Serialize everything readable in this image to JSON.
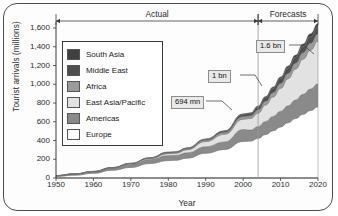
{
  "chart_data": {
    "type": "area",
    "title": "",
    "xlabel": "Year",
    "ylabel": "Tourist arrivals (millions)",
    "xlim": [
      1950,
      2020
    ],
    "ylim": [
      0,
      1600
    ],
    "ytick_labels": [
      "0",
      "200",
      "400",
      "600",
      "800",
      "1,000",
      "1,200",
      "1,400",
      "1,600"
    ],
    "ytick_values": [
      0,
      200,
      400,
      600,
      800,
      1000,
      1200,
      1400,
      1600
    ],
    "xtick_labels": [
      "1950",
      "1960",
      "1970",
      "1980",
      "1990",
      "2000",
      "2010",
      "2020"
    ],
    "xtick_values": [
      1950,
      1960,
      1970,
      1980,
      1990,
      2000,
      2010,
      2020
    ],
    "grid": false,
    "stacked": true,
    "legend_position": "upper-left inside",
    "x": [
      1950,
      1955,
      1960,
      1965,
      1970,
      1975,
      1980,
      1982,
      1985,
      1990,
      1995,
      2000,
      2002,
      2004,
      2006,
      2008,
      2010,
      2012,
      2014,
      2016,
      2018,
      2020
    ],
    "series": [
      {
        "name": "Europe",
        "color": "#ffffff",
        "values": [
          17,
          30,
          50,
          83,
          113,
          154,
          186,
          190,
          212,
          265,
          304,
          390,
          394,
          424,
          465,
          505,
          545,
          590,
          635,
          680,
          720,
          760
        ]
      },
      {
        "name": "Americas",
        "color": "#8a8a8a",
        "values": [
          8,
          12,
          17,
          23,
          33,
          43,
          53,
          52,
          57,
          69,
          81,
          128,
          117,
          126,
          139,
          152,
          166,
          181,
          197,
          213,
          229,
          245
        ]
      },
      {
        "name": "East Asia/Pacific",
        "color": "#e2e2e2",
        "values": [
          0.2,
          1,
          1.5,
          2.5,
          6,
          10,
          21,
          22,
          32,
          55,
          81,
          110,
          124,
          142,
          175,
          208,
          245,
          288,
          330,
          375,
          415,
          455
        ]
      },
      {
        "name": "Africa",
        "color": "#9b9b9b",
        "values": [
          0.5,
          1,
          1,
          1.5,
          2.5,
          5,
          7.5,
          8,
          10,
          15,
          20,
          27,
          29,
          33,
          39,
          45,
          51,
          57,
          63,
          68,
          73,
          77
        ]
      },
      {
        "name": "Middle East",
        "color": "#4f4f4f",
        "values": [
          0.2,
          0.4,
          0.6,
          1.5,
          2,
          3,
          7,
          7,
          8,
          10,
          14,
          24,
          26,
          36,
          42,
          48,
          54,
          58,
          62,
          66,
          70,
          74
        ]
      },
      {
        "name": "South Asia",
        "color": "#404040",
        "values": [
          0.2,
          0.3,
          0.5,
          0.8,
          1,
          2,
          2,
          2,
          2.5,
          3,
          4,
          6,
          6,
          8,
          10,
          13,
          16,
          20,
          24,
          28,
          33,
          37
        ]
      }
    ],
    "annotations": [
      {
        "label": "694 mn",
        "year": 2003,
        "value": 694
      },
      {
        "label": "1 bn",
        "year": 2010,
        "value": 1000
      },
      {
        "label": "1.6 bn",
        "year": 2020,
        "value": 1600
      }
    ],
    "span_markers": [
      {
        "label": "Actual",
        "from": 1950,
        "to": 2004
      },
      {
        "label": "Forecasts",
        "from": 2004,
        "to": 2020
      }
    ],
    "divider_year": 2004
  },
  "legend": {
    "items": [
      {
        "label": "South Asia",
        "color": "#404040"
      },
      {
        "label": "Middle East",
        "color": "#4f4f4f"
      },
      {
        "label": "Africa",
        "color": "#9b9b9b"
      },
      {
        "label": "East Asia/Pacific",
        "color": "#e2e2e2"
      },
      {
        "label": "Americas",
        "color": "#8a8a8a"
      },
      {
        "label": "Europe",
        "color": "#ffffff"
      }
    ]
  }
}
